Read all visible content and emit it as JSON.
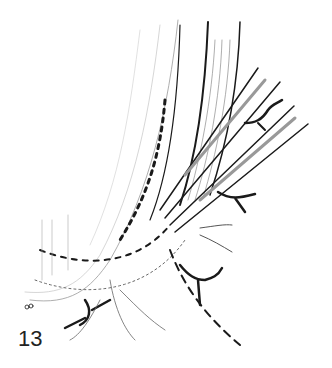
{
  "figure": {
    "number": "13",
    "type": "surgical line illustration",
    "colors": {
      "ink": "#1a1a1a",
      "light_ink": "#888888",
      "background": "#ffffff"
    }
  }
}
